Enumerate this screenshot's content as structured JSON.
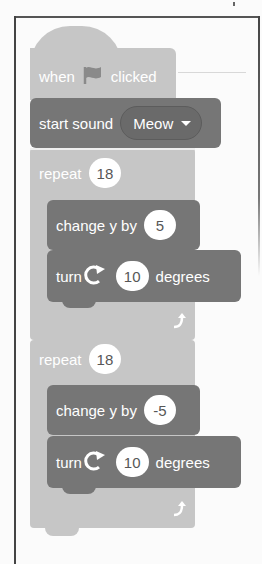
{
  "script": {
    "hat_block": {
      "text_before": "when",
      "icon": "green-flag-icon",
      "text_after": "clicked"
    },
    "sound_block": {
      "label": "start sound",
      "dropdown_value": "Meow"
    },
    "loops": [
      {
        "label": "repeat",
        "count": "18",
        "blocks": [
          {
            "label": "change y by",
            "value": "5"
          },
          {
            "label_before": "turn",
            "icon": "rotate-clockwise-icon",
            "value": "10",
            "label_after": "degrees"
          }
        ]
      },
      {
        "label": "repeat",
        "count": "18",
        "blocks": [
          {
            "label": "change y by",
            "value": "-5"
          },
          {
            "label_before": "turn",
            "icon": "rotate-clockwise-icon",
            "value": "10",
            "label_after": "degrees"
          }
        ]
      }
    ]
  },
  "colors": {
    "event_block": "#c6c6c6",
    "motion_block": "#767676",
    "input_bg": "#ffffff",
    "frame_border": "#444444"
  }
}
